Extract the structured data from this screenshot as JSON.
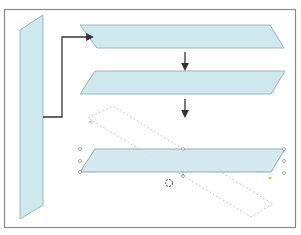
{
  "diagram": {
    "colors": {
      "background": "#ffffff",
      "frame_stroke": "#8a8a8a",
      "shape_fill": "#cfe8ee",
      "shape_stroke": "#9bb6bd",
      "connector": "#333333",
      "dashed_outline": "#bdbdbd",
      "handle": "#9a9a9a",
      "handle_yellow": "#d8c25a"
    },
    "shapes": [
      {
        "id": "vertical-parallelogram",
        "points": "20,30 43,15 43,205 20,219"
      },
      {
        "id": "step1-parallelogram",
        "points": "80,25 270,25 284,48 97,48"
      },
      {
        "id": "step2-parallelogram",
        "points": "95,71 285,71 271,94 80,94"
      },
      {
        "id": "step3-parallelogram-selected",
        "points": "95,149 285,149 271,172 80,172"
      }
    ],
    "rotated_outline": {
      "points": "113,106 273,204 251,217 88,118"
    },
    "connector": {
      "points": "43,117 62,117 62,37 90,37"
    },
    "arrows": [
      {
        "x": 185,
        "y1": 52,
        "y2": 67
      },
      {
        "x": 185,
        "y1": 99,
        "y2": 114
      }
    ],
    "handles": [
      {
        "cx": 80,
        "cy": 149
      },
      {
        "cx": 80,
        "cy": 161
      },
      {
        "cx": 80,
        "cy": 172
      },
      {
        "cx": 183,
        "cy": 149
      },
      {
        "cx": 183,
        "cy": 176
      },
      {
        "cx": 284,
        "cy": 149
      },
      {
        "cx": 284,
        "cy": 161
      },
      {
        "cx": 284,
        "cy": 173
      }
    ],
    "yellow_handle": {
      "cx": 270,
      "cy": 178
    },
    "rotate_handle": {
      "cx": 169,
      "cy": 183,
      "r": 3.5
    },
    "corner_marker": {
      "x": 88,
      "y": 124
    }
  }
}
